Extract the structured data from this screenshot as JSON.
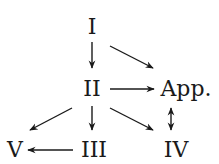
{
  "diagram": {
    "type": "directed-graph",
    "nodes": [
      {
        "id": "I",
        "label": "I",
        "x": 92,
        "y": 27
      },
      {
        "id": "II",
        "label": "II",
        "x": 92,
        "y": 89
      },
      {
        "id": "App",
        "label": "App.",
        "x": 185,
        "y": 89
      },
      {
        "id": "III",
        "label": "III",
        "x": 93,
        "y": 150
      },
      {
        "id": "IV",
        "label": "IV",
        "x": 176,
        "y": 150
      },
      {
        "id": "V",
        "label": "V",
        "x": 15,
        "y": 150
      }
    ],
    "edges": [
      {
        "from": "I",
        "to": "II",
        "style": "single-arrow"
      },
      {
        "from": "I",
        "to": "App.",
        "style": "single-arrow"
      },
      {
        "from": "II",
        "to": "App.",
        "style": "single-arrow"
      },
      {
        "from": "II",
        "to": "V",
        "style": "single-arrow"
      },
      {
        "from": "II",
        "to": "III",
        "style": "single-arrow"
      },
      {
        "from": "II",
        "to": "IV",
        "style": "single-arrow"
      },
      {
        "from": "App.",
        "to": "IV",
        "style": "double-arrow"
      },
      {
        "from": "III",
        "to": "V",
        "style": "single-arrow"
      }
    ],
    "colors": {
      "ink": "#1a1a1a",
      "background": "#ffffff"
    }
  }
}
